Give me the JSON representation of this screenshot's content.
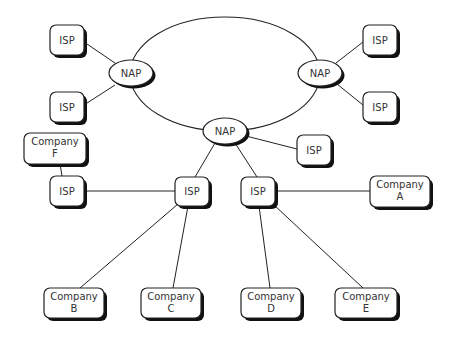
{
  "diagram": {
    "type": "network-topology",
    "colors": {
      "stroke": "#222222",
      "shadow": "#111111",
      "fill": "#ffffff",
      "text": "#333333"
    },
    "ring": {
      "cx": 225,
      "cy": 74,
      "rx": 95,
      "ry": 57
    },
    "naps": [
      {
        "id": "nap-left",
        "label": "NAP",
        "cx": 131,
        "cy": 73,
        "rx": 22,
        "ry": 13
      },
      {
        "id": "nap-right",
        "label": "NAP",
        "cx": 320,
        "cy": 73,
        "rx": 22,
        "ry": 13
      },
      {
        "id": "nap-center",
        "label": "NAP",
        "cx": 225,
        "cy": 131,
        "rx": 22,
        "ry": 13
      }
    ],
    "boxes": [
      {
        "id": "isp-top-left-1",
        "lines": [
          "ISP"
        ],
        "x": 50,
        "y": 25,
        "w": 34,
        "h": 30
      },
      {
        "id": "isp-top-left-2",
        "lines": [
          "ISP"
        ],
        "x": 50,
        "y": 92,
        "w": 34,
        "h": 30
      },
      {
        "id": "isp-top-right-1",
        "lines": [
          "ISP"
        ],
        "x": 363,
        "y": 25,
        "w": 34,
        "h": 30
      },
      {
        "id": "isp-top-right-2",
        "lines": [
          "ISP"
        ],
        "x": 363,
        "y": 92,
        "w": 34,
        "h": 30
      },
      {
        "id": "isp-center-right",
        "lines": [
          "ISP"
        ],
        "x": 297,
        "y": 135,
        "w": 34,
        "h": 30
      },
      {
        "id": "company-f",
        "lines": [
          "Company",
          "F"
        ],
        "x": 24,
        "y": 133,
        "w": 62,
        "h": 31
      },
      {
        "id": "isp-lower-left",
        "lines": [
          "ISP"
        ],
        "x": 50,
        "y": 176,
        "w": 34,
        "h": 30
      },
      {
        "id": "isp-lower-mid-1",
        "lines": [
          "ISP"
        ],
        "x": 175,
        "y": 177,
        "w": 34,
        "h": 29
      },
      {
        "id": "isp-lower-mid-2",
        "lines": [
          "ISP"
        ],
        "x": 241,
        "y": 177,
        "w": 34,
        "h": 29
      },
      {
        "id": "company-a",
        "lines": [
          "Company",
          "A"
        ],
        "x": 370,
        "y": 176,
        "w": 60,
        "h": 31
      },
      {
        "id": "company-b",
        "lines": [
          "Company",
          "B"
        ],
        "x": 44,
        "y": 288,
        "w": 60,
        "h": 30
      },
      {
        "id": "company-c",
        "lines": [
          "Company",
          "C"
        ],
        "x": 141,
        "y": 288,
        "w": 60,
        "h": 30
      },
      {
        "id": "company-d",
        "lines": [
          "Company",
          "D"
        ],
        "x": 241,
        "y": 288,
        "w": 60,
        "h": 30
      },
      {
        "id": "company-e",
        "lines": [
          "Company",
          "E"
        ],
        "x": 335,
        "y": 288,
        "w": 62,
        "h": 30
      }
    ],
    "edges": [
      {
        "from": "isp-top-left-1",
        "to": "nap-left",
        "x1": 84,
        "y1": 42,
        "x2": 115,
        "y2": 63
      },
      {
        "from": "isp-top-left-2",
        "to": "nap-left",
        "x1": 84,
        "y1": 105,
        "x2": 115,
        "y2": 85
      },
      {
        "from": "nap-right",
        "to": "isp-top-right-1",
        "x1": 336,
        "y1": 63,
        "x2": 363,
        "y2": 42
      },
      {
        "from": "nap-right",
        "to": "isp-top-right-2",
        "x1": 337,
        "y1": 84,
        "x2": 363,
        "y2": 105
      },
      {
        "from": "nap-center",
        "to": "isp-center-right",
        "x1": 246,
        "y1": 136,
        "x2": 297,
        "y2": 149
      },
      {
        "from": "nap-center",
        "to": "isp-lower-mid-1",
        "x1": 215,
        "y1": 143,
        "x2": 195,
        "y2": 177
      },
      {
        "from": "nap-center",
        "to": "isp-lower-mid-2",
        "x1": 235,
        "y1": 143,
        "x2": 257,
        "y2": 177
      },
      {
        "from": "company-f",
        "to": "isp-lower-left",
        "x1": 60,
        "y1": 164,
        "x2": 62,
        "y2": 176
      },
      {
        "from": "isp-lower-left",
        "to": "isp-lower-mid-1",
        "x1": 84,
        "y1": 191,
        "x2": 175,
        "y2": 191
      },
      {
        "from": "isp-lower-mid-2",
        "to": "company-a",
        "x1": 275,
        "y1": 191,
        "x2": 370,
        "y2": 191
      },
      {
        "from": "isp-lower-mid-1",
        "to": "company-b",
        "x1": 178,
        "y1": 204,
        "x2": 80,
        "y2": 288
      },
      {
        "from": "isp-lower-mid-1",
        "to": "company-c",
        "x1": 188,
        "y1": 206,
        "x2": 173,
        "y2": 288
      },
      {
        "from": "isp-lower-mid-2",
        "to": "company-d",
        "x1": 259,
        "y1": 206,
        "x2": 270,
        "y2": 288
      },
      {
        "from": "isp-lower-mid-2",
        "to": "company-e",
        "x1": 274,
        "y1": 205,
        "x2": 363,
        "y2": 288
      }
    ]
  }
}
